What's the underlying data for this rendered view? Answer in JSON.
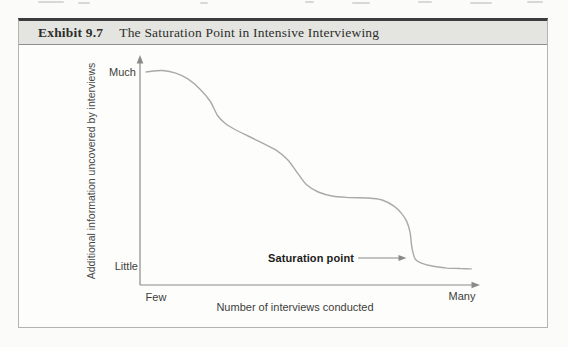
{
  "header": {
    "exhibit_label": "Exhibit 9.7",
    "title": "The Saturation Point in Intensive Interviewing"
  },
  "chart_data": {
    "type": "line",
    "title": "The Saturation Point in Intensive Interviewing",
    "xlabel": "Number of interviews conducted",
    "ylabel": "Additional information uncovered by interviews",
    "x_tick_labels": [
      "Few",
      "Many"
    ],
    "y_tick_labels": [
      "Little",
      "Much"
    ],
    "x_range": [
      0,
      100
    ],
    "y_range": [
      0,
      100
    ],
    "grid": false,
    "legend": null,
    "annotation": {
      "label": "Saturation point",
      "x": 78.5,
      "y": 12
    },
    "series": [
      {
        "name": "Additional information uncovered",
        "x": [
          1.8,
          6.5,
          10.3,
          14.1,
          17.6,
          20.6,
          22.9,
          25.3,
          28.2,
          31.8,
          35.9,
          40.0,
          43.5,
          46.5,
          49.1,
          52.4,
          56.5,
          61.8,
          67.1,
          71.2,
          74.7,
          77.1,
          78.5,
          79.4,
          80.0,
          80.9,
          82.6,
          85.9,
          90.3,
          94.1,
          97.4
        ],
        "y": [
          95.5,
          96.2,
          95.1,
          92.4,
          87.9,
          82.5,
          75.8,
          72.2,
          69.5,
          66.8,
          63.7,
          60.5,
          56.1,
          49.8,
          44.8,
          41.7,
          39.9,
          39.2,
          39.0,
          38.1,
          35.4,
          31.8,
          28.3,
          23.8,
          16.6,
          11.7,
          9.9,
          8.5,
          7.6,
          7.4,
          7.2
        ]
      }
    ]
  },
  "colors": {
    "header_bg": "#e4e5e1",
    "box_border_dark": "#3c3c3c",
    "box_border_light": "#b3b3b0",
    "axis": "#8a8a88",
    "curve": "#a9a9a7",
    "text": "#3d3d3b",
    "annotation_text": "#1c1c1a"
  }
}
